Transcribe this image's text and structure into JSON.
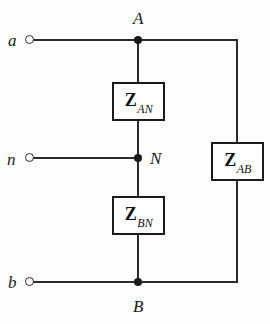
{
  "diagram": {
    "background_color": "#fdfdfb",
    "line_color": "#2b2b2b",
    "terminals": [
      {
        "id": "a",
        "label": "a",
        "icon": "open-circle-terminal",
        "y": 40
      },
      {
        "id": "n",
        "label": "n",
        "icon": "open-circle-terminal",
        "y": 158
      },
      {
        "id": "b",
        "label": "b",
        "icon": "open-circle-terminal",
        "y": 282
      }
    ],
    "nodes": [
      {
        "id": "A",
        "label": "A",
        "icon": "junction-dot",
        "position": "above",
        "x": 138,
        "y": 40
      },
      {
        "id": "N",
        "label": "N",
        "icon": "junction-dot",
        "position": "right",
        "x": 138,
        "y": 158
      },
      {
        "id": "B",
        "label": "B",
        "icon": "junction-dot",
        "position": "below",
        "x": 138,
        "y": 282
      }
    ],
    "impedances": [
      {
        "id": "ZAN",
        "symbol": "Z",
        "subscript": "AN",
        "between": [
          "A",
          "N"
        ],
        "orientation": "vertical"
      },
      {
        "id": "ZBN",
        "symbol": "Z",
        "subscript": "BN",
        "between": [
          "B",
          "N"
        ],
        "orientation": "vertical"
      },
      {
        "id": "ZAB",
        "symbol": "Z",
        "subscript": "AB",
        "between": [
          "A",
          "B"
        ],
        "orientation": "vertical"
      }
    ]
  }
}
